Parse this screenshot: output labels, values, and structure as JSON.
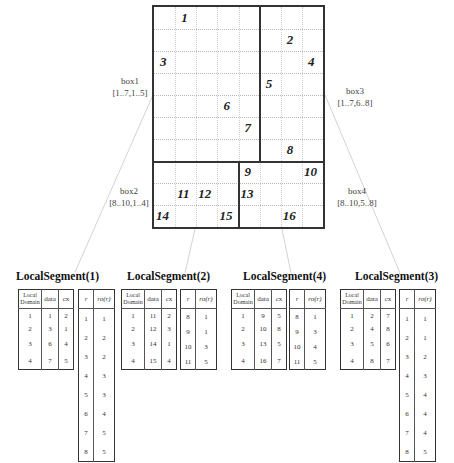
{
  "grid": {
    "rows": 10,
    "cols": 8,
    "cells": [
      {
        "label": "1",
        "row": 1,
        "col": 2
      },
      {
        "label": "2",
        "row": 2,
        "col": 7
      },
      {
        "label": "3",
        "row": 3,
        "col": 1
      },
      {
        "label": "4",
        "row": 3,
        "col": 8
      },
      {
        "label": "5",
        "row": 4,
        "col": 6
      },
      {
        "label": "6",
        "row": 5,
        "col": 4
      },
      {
        "label": "7",
        "row": 6,
        "col": 5
      },
      {
        "label": "8",
        "row": 7,
        "col": 7
      },
      {
        "label": "9",
        "row": 8,
        "col": 5
      },
      {
        "label": "10",
        "row": 8,
        "col": 8
      },
      {
        "label": "11",
        "row": 9,
        "col": 2
      },
      {
        "label": "12",
        "row": 9,
        "col": 3
      },
      {
        "label": "13",
        "row": 9,
        "col": 5
      },
      {
        "label": "14",
        "row": 10,
        "col": 1
      },
      {
        "label": "15",
        "row": 10,
        "col": 4
      },
      {
        "label": "16",
        "row": 10,
        "col": 7
      }
    ]
  },
  "boxes": [
    {
      "name": "box1",
      "range": "[1..7,1..5]"
    },
    {
      "name": "box2",
      "range": "[8..10,1..4]"
    },
    {
      "name": "box3",
      "range": "[1..7,6..8]"
    },
    {
      "name": "box4",
      "range": "[8..10,5..8]"
    }
  ],
  "segments": [
    {
      "title": "LocalSegment(1)",
      "domain_headers": [
        "Local Domain",
        "data",
        "cx"
      ],
      "domain_rows": [
        [
          "1",
          "1",
          "2"
        ],
        [
          "2",
          "3",
          "1"
        ],
        [
          "3",
          "6",
          "4"
        ],
        [
          "4",
          "7",
          "5"
        ]
      ],
      "ro_headers": [
        "r",
        "ro(r)"
      ],
      "ro_rows": [
        [
          "1",
          "1"
        ],
        [
          "2",
          "2"
        ],
        [
          "3",
          "2"
        ],
        [
          "4",
          "3"
        ],
        [
          "5",
          "3"
        ],
        [
          "6",
          "4"
        ],
        [
          "7",
          "5"
        ],
        [
          "8",
          "5"
        ]
      ]
    },
    {
      "title": "LocalSegment(2)",
      "domain_headers": [
        "Local Domain",
        "data",
        "cx"
      ],
      "domain_rows": [
        [
          "1",
          "11",
          "2"
        ],
        [
          "2",
          "12",
          "3"
        ],
        [
          "3",
          "14",
          "1"
        ],
        [
          "4",
          "15",
          "4"
        ]
      ],
      "ro_headers": [
        "r",
        "ro(r)"
      ],
      "ro_rows": [
        [
          "8",
          "1"
        ],
        [
          "9",
          "1"
        ],
        [
          "10",
          "3"
        ],
        [
          "11",
          "5"
        ]
      ]
    },
    {
      "title": "LocalSegment(4)",
      "domain_headers": [
        "Local Domain",
        "data",
        "cx"
      ],
      "domain_rows": [
        [
          "1",
          "9",
          "5"
        ],
        [
          "2",
          "10",
          "8"
        ],
        [
          "3",
          "13",
          "5"
        ],
        [
          "4",
          "16",
          "7"
        ]
      ],
      "ro_headers": [
        "r",
        "ro(r)"
      ],
      "ro_rows": [
        [
          "8",
          "1"
        ],
        [
          "9",
          "3"
        ],
        [
          "10",
          "4"
        ],
        [
          "11",
          "5"
        ]
      ]
    },
    {
      "title": "LocalSegment(3)",
      "domain_headers": [
        "Local Domain",
        "data",
        "cx"
      ],
      "domain_rows": [
        [
          "1",
          "2",
          "7"
        ],
        [
          "2",
          "4",
          "8"
        ],
        [
          "3",
          "5",
          "6"
        ],
        [
          "4",
          "8",
          "7"
        ]
      ],
      "ro_headers": [
        "r",
        "ro(r)"
      ],
      "ro_rows": [
        [
          "1",
          "1"
        ],
        [
          "2",
          "1"
        ],
        [
          "3",
          "2"
        ],
        [
          "4",
          "3"
        ],
        [
          "5",
          "4"
        ],
        [
          "6",
          "4"
        ],
        [
          "7",
          "4"
        ],
        [
          "8",
          "5"
        ]
      ]
    }
  ]
}
